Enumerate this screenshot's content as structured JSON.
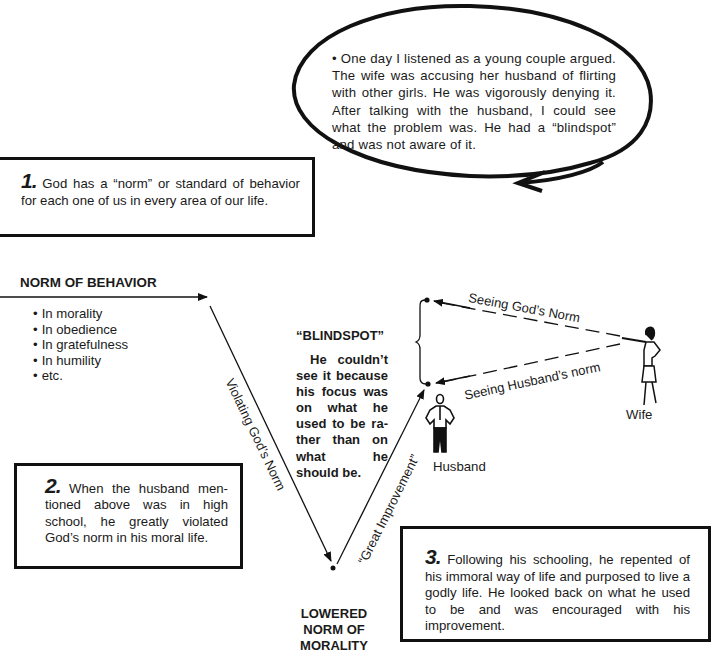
{
  "story_bubble": {
    "text": "• One day I listened as a young couple argued. The wife was accusing her husband of flirting with other girls. He was vigorously denying it. After talking with the husband, I could see what the problem was. He had a “blindspot” and was not aware of it."
  },
  "box1": {
    "number": "1.",
    "text": "God has a “norm” or standard of behavior for each one of us in every area of our life."
  },
  "norm_of_behavior": {
    "title": "NORM OF BEHAVIOR",
    "items": [
      "In morality",
      "In obedience",
      "In gratefulness",
      "In humility",
      "etc."
    ]
  },
  "arrows": {
    "violating": "Violating God’s Norm",
    "improvement": "“Great Improvement”",
    "seeing_god": "Seeing God’s Norm",
    "seeing_husband": "Seeing Husband’s norm"
  },
  "blindspot": {
    "title": "“BLINDSPOT”",
    "text": "He couldn’t see it because his focus was on what he used to be ra-ther than on what he should be."
  },
  "lowered_norm": {
    "text": "LOWERED NORM OF MORALITY"
  },
  "figures": {
    "husband": "Husband",
    "wife": "Wife"
  },
  "box2": {
    "number": "2.",
    "text": "When the husband men-tioned above was in high school, he greatly violated God’s norm in his moral life."
  },
  "box3": {
    "number": "3.",
    "text": "Following his schooling, he repented of his immoral way of life and purposed to live a godly life. He looked back on what he used to be and was encouraged with his improvement."
  }
}
